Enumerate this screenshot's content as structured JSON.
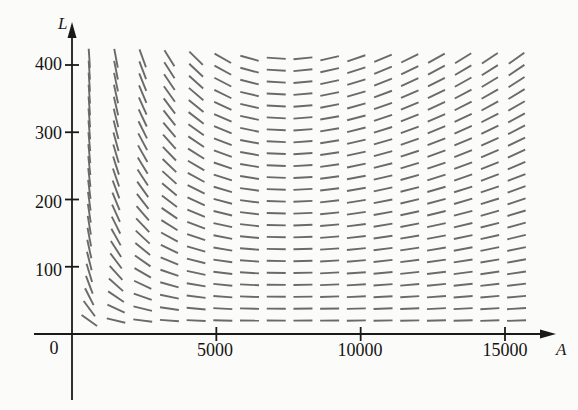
{
  "chart_data": {
    "type": "line",
    "subtype": "slope-field",
    "title": "",
    "subtitle": "",
    "xlabel": "A",
    "ylabel": "L",
    "xlim": [
      0,
      16000
    ],
    "ylim": [
      0,
      440
    ],
    "grid": false,
    "legend": null,
    "annotations": [],
    "x_ticks": [
      {
        "value": 5000,
        "label": "5000"
      },
      {
        "value": 10000,
        "label": "10000"
      },
      {
        "value": 15000,
        "label": "15000"
      }
    ],
    "y_ticks": [
      {
        "value": 100,
        "label": "100"
      },
      {
        "value": 200,
        "label": "200"
      },
      {
        "value": 300,
        "label": "300"
      },
      {
        "value": 400,
        "label": "400"
      }
    ],
    "origin_label": "0",
    "axis_color": "#1a1a1a",
    "segment_color": "#6a6a6a",
    "background_color": "#fbfbf9",
    "field_domain": {
      "a_min": 600,
      "a_max": 15400,
      "l_min": 20,
      "l_max": 410,
      "a_steps": 17,
      "l_steps": 23
    },
    "model": {
      "description": "Lotka-Volterra style predator-prey direction field dL/dA",
      "equilibrium_a": 7400,
      "equilibrium_l": 200,
      "prey_growth": 1.0,
      "predation": 0.00013,
      "predator_death": 1.0,
      "conversion": 0.000135,
      "slope_scale": 0.0185
    },
    "segments_note": "Each tick is a short line segment whose angle equals the local slope dL/dA of the system; segments are rendered from the model parameters above."
  },
  "figure": {
    "y_axis_name": "L",
    "x_axis_name": "A",
    "origin": "0"
  }
}
